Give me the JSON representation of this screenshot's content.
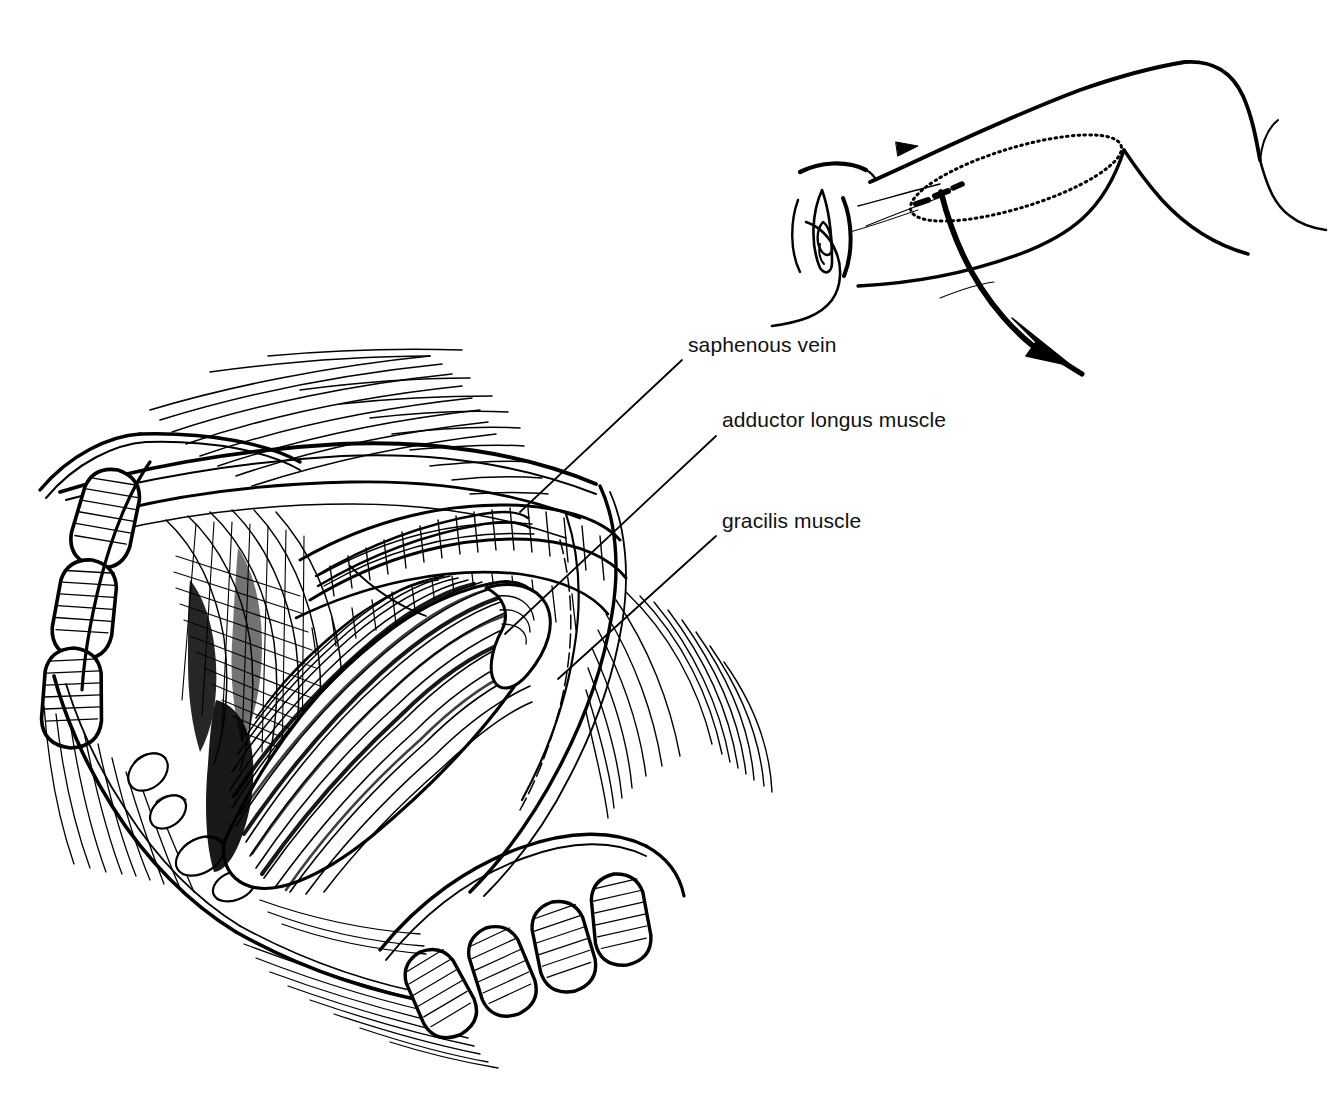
{
  "figure": {
    "kind": "medical-line-illustration",
    "technique": "pen-and-ink hatching",
    "ink_color": "#000000",
    "background_color": "#ffffff",
    "width": 1339,
    "height": 1105
  },
  "labels": [
    {
      "id": "saphenous-vein",
      "text": "saphenous vein",
      "x": 688,
      "y": 345,
      "leader": {
        "x1": 682,
        "y1": 360,
        "x2": 520,
        "y2": 512
      }
    },
    {
      "id": "adductor-longus-muscle",
      "text": "adductor longus muscle",
      "x": 722,
      "y": 420,
      "leader": {
        "x1": 716,
        "y1": 436,
        "x2": 505,
        "y2": 634
      }
    },
    {
      "id": "gracilis-muscle",
      "text": "gracilis muscle",
      "x": 722,
      "y": 521,
      "leader": {
        "x1": 716,
        "y1": 536,
        "x2": 558,
        "y2": 679
      }
    }
  ],
  "inset": {
    "id": "orientation-inset",
    "description": "Patient in lithotomy position: perineum at left, flexed thigh and knee to the right",
    "flap_outline": {
      "shape": "dotted-ellipse",
      "style": "dotted",
      "meaning": "skin paddle outline over gracilis"
    },
    "rotation_arrow": {
      "style": "solid-curved-arrow",
      "direction": "down-right",
      "meaning": "direction of flap transposition"
    }
  },
  "main_view": {
    "id": "operative-field",
    "retractor_top_blades": 3,
    "retractor_bottom_blades": 4,
    "structures": [
      "retracted skin and subcutaneous fat",
      "femoral triangle contents",
      "adductor longus muscle",
      "gracilis muscle belly",
      "saphenous vein",
      "lymph nodes",
      "deep fascia of thigh"
    ]
  }
}
